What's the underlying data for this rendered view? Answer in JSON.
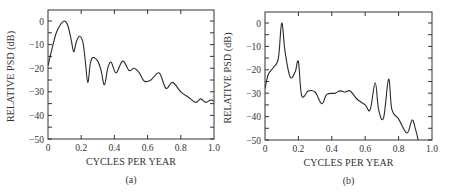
{
  "chart_data": [
    {
      "type": "line",
      "panel": "(a)",
      "title": "",
      "xlabel": "CYCLES PER YEAR",
      "ylabel": "RELATIVE PSD (dB)",
      "xlim": [
        0,
        1.0
      ],
      "ylim": [
        -50,
        5
      ],
      "xticks": [
        "0",
        "0.2",
        "0.4",
        "0.6",
        "0.8",
        "1.0"
      ],
      "yticks": [
        "0",
        "−10",
        "−20",
        "−30",
        "−40",
        "−50"
      ],
      "grid": false,
      "x": [
        0,
        0.02,
        0.05,
        0.08,
        0.1,
        0.12,
        0.14,
        0.155,
        0.17,
        0.19,
        0.21,
        0.225,
        0.24,
        0.255,
        0.27,
        0.3,
        0.32,
        0.34,
        0.36,
        0.38,
        0.41,
        0.45,
        0.49,
        0.52,
        0.55,
        0.58,
        0.62,
        0.67,
        0.71,
        0.75,
        0.8,
        0.85,
        0.89,
        0.92,
        0.95,
        0.98,
        1.0
      ],
      "series": [
        {
          "name": "PSD (a)",
          "values": [
            -19,
            -13,
            -5,
            -1,
            0,
            -2,
            -8,
            -13,
            -9,
            -6.5,
            -9,
            -17,
            -26,
            -18,
            -15.5,
            -17,
            -21,
            -27,
            -20,
            -17.5,
            -22,
            -17,
            -21,
            -20,
            -22,
            -25.5,
            -25,
            -22,
            -28.5,
            -26,
            -30,
            -32.5,
            -34.5,
            -33,
            -34.5,
            -33.5,
            -34
          ]
        }
      ]
    },
    {
      "type": "line",
      "panel": "(b)",
      "title": "",
      "xlabel": "CYCLES PER YEAR",
      "ylabel": "RELATIVE PSD (dB)",
      "xlim": [
        0,
        1.0
      ],
      "ylim": [
        -50,
        5
      ],
      "xticks": [
        "0",
        "0.2",
        "0.4",
        "0.6",
        "0.8",
        "1.0"
      ],
      "yticks": [
        "0",
        "−10",
        "−20",
        "−30",
        "−40",
        "−50"
      ],
      "grid": false,
      "x": [
        0,
        0.02,
        0.05,
        0.08,
        0.1,
        0.12,
        0.15,
        0.18,
        0.2,
        0.22,
        0.26,
        0.3,
        0.34,
        0.37,
        0.42,
        0.45,
        0.48,
        0.51,
        0.55,
        0.6,
        0.63,
        0.66,
        0.68,
        0.71,
        0.74,
        0.76,
        0.8,
        0.85,
        0.88,
        0.9,
        0.92
      ],
      "series": [
        {
          "name": "PSD (b)",
          "values": [
            -28,
            -22,
            -19,
            -15,
            0,
            -12,
            -23,
            -21,
            -16.5,
            -31,
            -29,
            -29.5,
            -34.5,
            -30.5,
            -30,
            -29,
            -29.5,
            -29,
            -32.5,
            -35,
            -37,
            -25.5,
            -37,
            -40.5,
            -24,
            -37,
            -41,
            -47,
            -41.5,
            -45,
            -51
          ]
        }
      ]
    }
  ],
  "figure": {
    "panels": [
      {
        "label": "(a)",
        "xlabel": "CYCLES PER YEAR",
        "ylabel": "RELATIVE PSD (dB)"
      },
      {
        "label": "(b)",
        "xlabel": "CYCLES PER YEAR",
        "ylabel": "RELATIVE PSD (dB)"
      }
    ]
  }
}
